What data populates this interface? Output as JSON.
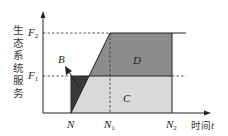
{
  "axes": {
    "y_label": "生态系统服务",
    "x_label": "时间",
    "x_var": "t"
  },
  "y_ticks": [
    {
      "name": "F",
      "sub": "2",
      "id": "F2"
    },
    {
      "name": "F",
      "sub": "1",
      "id": "F1"
    }
  ],
  "x_ticks": [
    {
      "name": "N",
      "sub": "",
      "id": "N"
    },
    {
      "name": "N",
      "sub": "1",
      "id": "N1"
    },
    {
      "name": "N",
      "sub": "2",
      "id": "N2"
    }
  ],
  "regions": {
    "B": {
      "label": "B",
      "color": "#3a3a3a"
    },
    "C": {
      "label": "C",
      "color": "#d9d9d9"
    },
    "D": {
      "label": "D",
      "color": "#8c8c8c"
    }
  },
  "colors": {
    "axis": "#222222",
    "dashed": "#333333"
  }
}
